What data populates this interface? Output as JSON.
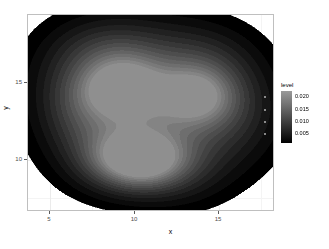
{
  "chart_data": {
    "type": "heatmap",
    "subtype": "filled-contour-2d-density",
    "title": "",
    "xlabel": "x",
    "ylabel": "y",
    "xlim": [
      3.7,
      18.3
    ],
    "ylim": [
      6.6,
      19.4
    ],
    "x_ticks": [
      5,
      10,
      15
    ],
    "x_tick_labels": [
      "5",
      "10",
      "15"
    ],
    "y_ticks": [
      10,
      15
    ],
    "y_tick_labels": [
      "10",
      "15"
    ],
    "grid": true,
    "grid_color": "#ebebeb",
    "panel_background": "#ffffff",
    "panel_border_color": "#bfbfbf",
    "legend": {
      "title": "level",
      "position": "right",
      "type": "colorbar",
      "ticks": [
        0.02,
        0.015,
        0.01,
        0.005
      ],
      "tick_labels": [
        "0.020",
        "0.015",
        "0.010",
        "0.005"
      ],
      "range": [
        0.0015,
        0.0225
      ],
      "color_low": "#000000",
      "color_high": "#9a9a9a"
    },
    "contour_levels": [
      0.0015,
      0.003,
      0.0045,
      0.006,
      0.0075,
      0.009,
      0.0105,
      0.012,
      0.0135,
      0.015,
      0.0165,
      0.018,
      0.0195,
      0.021
    ],
    "peaks": [
      {
        "x": 10.3,
        "y": 9.9,
        "level": 0.0215,
        "sigma_x": 1.85,
        "sigma_y": 1.25
      },
      {
        "x": 9.4,
        "y": 14.6,
        "level": 0.015,
        "sigma_x": 1.7,
        "sigma_y": 1.4
      },
      {
        "x": 13.7,
        "y": 14.1,
        "level": 0.013,
        "sigma_x": 1.55,
        "sigma_y": 1.35
      }
    ],
    "support_fill": [
      {
        "x": 11.0,
        "y": 14.8,
        "level": 0.0075,
        "sigma_x": 3.6,
        "sigma_y": 2.9
      },
      {
        "x": 11.3,
        "y": 12.4,
        "level": 0.006,
        "sigma_x": 3.9,
        "sigma_y": 2.6
      },
      {
        "x": 7.4,
        "y": 15.6,
        "level": 0.005,
        "sigma_x": 2.3,
        "sigma_y": 2.2
      },
      {
        "x": 15.6,
        "y": 13.2,
        "level": 0.0045,
        "sigma_x": 2.1,
        "sigma_y": 2.4
      },
      {
        "x": 8.2,
        "y": 10.7,
        "level": 0.0045,
        "sigma_x": 2.0,
        "sigma_y": 1.9
      },
      {
        "x": 12.5,
        "y": 9.2,
        "level": 0.004,
        "sigma_x": 2.2,
        "sigma_y": 1.7
      },
      {
        "x": 6.6,
        "y": 13.0,
        "level": 0.003,
        "sigma_x": 1.5,
        "sigma_y": 1.7
      },
      {
        "x": 13.9,
        "y": 16.6,
        "level": 0.003,
        "sigma_x": 2.1,
        "sigma_y": 1.5
      },
      {
        "x": 9.0,
        "y": 17.3,
        "level": 0.0028,
        "sigma_x": 2.2,
        "sigma_y": 1.3
      }
    ]
  },
  "axes": {
    "x_title": "x",
    "y_title": "y"
  },
  "legend_panel": {
    "title": "level",
    "labels": [
      "0.020",
      "0.015",
      "0.010",
      "0.005"
    ]
  },
  "ticks": {
    "x": [
      "5",
      "10",
      "15"
    ],
    "y": [
      "15",
      "10"
    ]
  }
}
